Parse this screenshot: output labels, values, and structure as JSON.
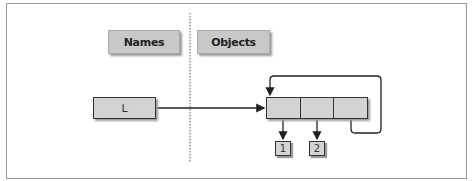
{
  "diagram": {
    "headers": {
      "names": "Names",
      "objects": "Objects"
    },
    "variable": {
      "name": "L"
    },
    "list_object": {
      "cells": 3,
      "description": "list with three slots; third slot references the list itself"
    },
    "items": [
      {
        "label": "1"
      },
      {
        "label": "2"
      }
    ],
    "colors": {
      "box_fill": "#d3d3d3",
      "header_fill": "#c8c8c8",
      "stroke": "#333333",
      "frame": "#9a9a9a"
    }
  }
}
